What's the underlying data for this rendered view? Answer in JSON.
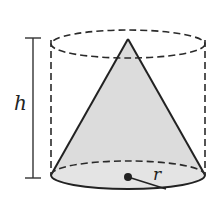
{
  "diagram": {
    "labels": {
      "height": "h",
      "radius": "r"
    },
    "colors": {
      "stroke": "#2a2a2a",
      "cone_fill": "#d9d9d9",
      "base_fill": "#e6e6e6",
      "background": "#ffffff"
    },
    "shapes": [
      {
        "name": "cylinder",
        "style": "dashed"
      },
      {
        "name": "cone",
        "style": "solid, shaded"
      },
      {
        "name": "height-marker",
        "label": "h"
      },
      {
        "name": "radius-marker",
        "label": "r"
      }
    ]
  }
}
